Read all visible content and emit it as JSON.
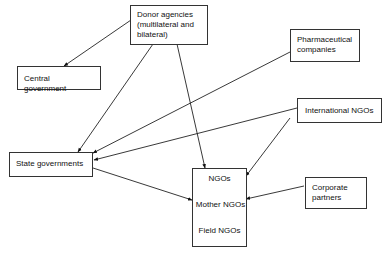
{
  "diagram": {
    "nodes": {
      "donor": {
        "label_line1": "Donor agencies",
        "label_line2": "(multilateral and",
        "label_line3": "bilateral)"
      },
      "central": {
        "label": "Central government"
      },
      "pharma": {
        "label_line1": "Pharmaceutical",
        "label_line2": "companies"
      },
      "intl_ngos": {
        "label": "International NGOs"
      },
      "state": {
        "label": "State governments"
      },
      "ngo_stack": {
        "ngos": "NGOs",
        "mother": "Mother NGOs",
        "field": "Field NGOs"
      },
      "corporate": {
        "label_line1": "Corporate",
        "label_line2": "partners"
      }
    },
    "edges": [
      {
        "from": "Donor agencies",
        "to": "Central government"
      },
      {
        "from": "Donor agencies",
        "to": "State governments"
      },
      {
        "from": "Donor agencies",
        "to": "NGOs"
      },
      {
        "from": "Pharmaceutical companies",
        "to": "State governments"
      },
      {
        "from": "International NGOs",
        "to": "State governments"
      },
      {
        "from": "International NGOs",
        "to": "NGOs"
      },
      {
        "from": "State governments",
        "to": "NGOs"
      },
      {
        "from": "Corporate partners",
        "to": "NGOs"
      },
      {
        "from": "NGOs",
        "to": "Mother NGOs"
      },
      {
        "from": "Mother NGOs",
        "to": "Field NGOs"
      }
    ]
  }
}
